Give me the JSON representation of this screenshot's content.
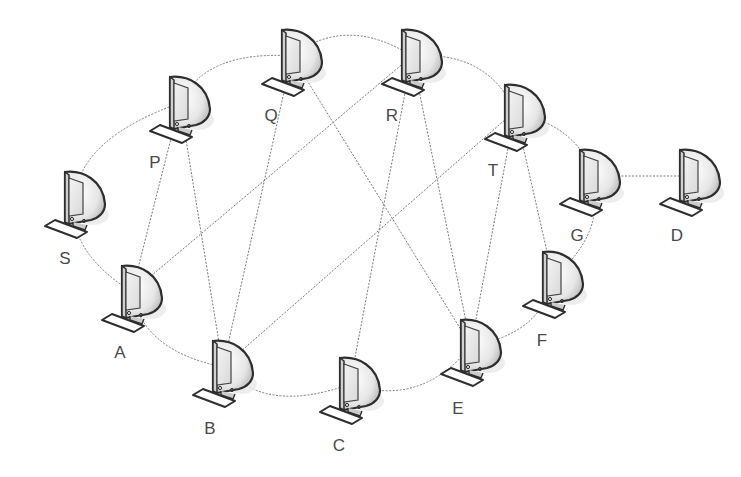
{
  "diagram": {
    "type": "network-topology",
    "nodes": [
      {
        "id": "P",
        "label": "P",
        "x": 150,
        "y": 75,
        "lx": 155,
        "ly": 168
      },
      {
        "id": "Q",
        "label": "Q",
        "x": 262,
        "y": 28,
        "lx": 271,
        "ly": 121
      },
      {
        "id": "R",
        "label": "R",
        "x": 382,
        "y": 28,
        "lx": 392,
        "ly": 121
      },
      {
        "id": "T",
        "label": "T",
        "x": 485,
        "y": 83,
        "lx": 493,
        "ly": 176
      },
      {
        "id": "G",
        "label": "G",
        "x": 560,
        "y": 148,
        "lx": 577,
        "ly": 241
      },
      {
        "id": "D",
        "label": "D",
        "x": 660,
        "y": 148,
        "lx": 677,
        "ly": 241
      },
      {
        "id": "S",
        "label": "S",
        "x": 45,
        "y": 170,
        "lx": 65,
        "ly": 264
      },
      {
        "id": "A",
        "label": "A",
        "x": 102,
        "y": 264,
        "lx": 120,
        "ly": 358
      },
      {
        "id": "B",
        "label": "B",
        "x": 193,
        "y": 339,
        "lx": 210,
        "ly": 434
      },
      {
        "id": "C",
        "label": "C",
        "x": 320,
        "y": 356,
        "lx": 339,
        "ly": 451
      },
      {
        "id": "E",
        "label": "E",
        "x": 441,
        "y": 318,
        "lx": 458,
        "ly": 414
      },
      {
        "id": "F",
        "label": "F",
        "x": 523,
        "y": 250,
        "lx": 542,
        "ly": 346
      }
    ],
    "ring_edges": [
      [
        "P",
        "Q"
      ],
      [
        "Q",
        "R"
      ],
      [
        "R",
        "T"
      ],
      [
        "T",
        "G"
      ],
      [
        "G",
        "F"
      ],
      [
        "F",
        "E"
      ],
      [
        "E",
        "C"
      ],
      [
        "C",
        "B"
      ],
      [
        "B",
        "A"
      ],
      [
        "A",
        "S"
      ],
      [
        "S",
        "P"
      ]
    ],
    "cross_edges": [
      [
        "P",
        "A"
      ],
      [
        "P",
        "B"
      ],
      [
        "A",
        "R"
      ],
      [
        "Q",
        "B"
      ],
      [
        "Q",
        "E"
      ],
      [
        "R",
        "C"
      ],
      [
        "R",
        "E"
      ],
      [
        "T",
        "B"
      ],
      [
        "T",
        "E"
      ],
      [
        "T",
        "F"
      ],
      [
        "G",
        "D"
      ]
    ]
  }
}
